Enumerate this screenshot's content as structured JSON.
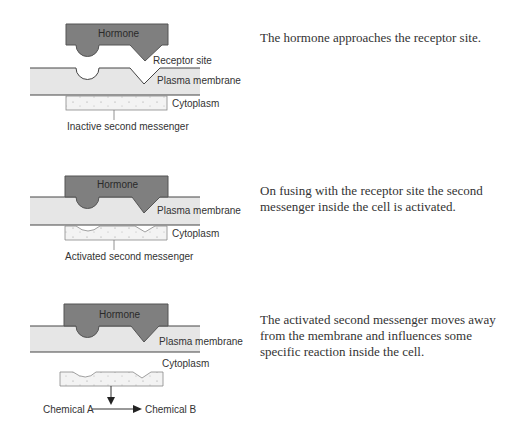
{
  "colors": {
    "hormone_fill": "#7f7f7f",
    "hormone_stroke": "#555555",
    "membrane_fill": "#e6e6e6",
    "membrane_line": "#444444",
    "messenger_fill": "#f3f3f3",
    "messenger_stroke": "#888888",
    "text": "#333333"
  },
  "stages": [
    {
      "labels": {
        "hormone": "Hormone",
        "receptor_site": "Receptor site",
        "plasma_membrane": "Plasma membrane",
        "cytoplasm": "Cytoplasm",
        "messenger": "Inactive second messenger"
      },
      "caption": "The hormone approaches the receptor site."
    },
    {
      "labels": {
        "hormone": "Hormone",
        "plasma_membrane": "Plasma membrane",
        "cytoplasm": "Cytoplasm",
        "messenger": "Activated second messenger"
      },
      "caption": "On fusing with the receptor site the second messenger inside the cell is activated."
    },
    {
      "labels": {
        "hormone": "Hormone",
        "plasma_membrane": "Plasma membrane",
        "cytoplasm": "Cytoplasm",
        "chemical_a": "Chemical A",
        "chemical_b": "Chemical B"
      },
      "caption": "The activated second messenger moves away from the membrane and influences some specific reaction inside the cell."
    }
  ]
}
